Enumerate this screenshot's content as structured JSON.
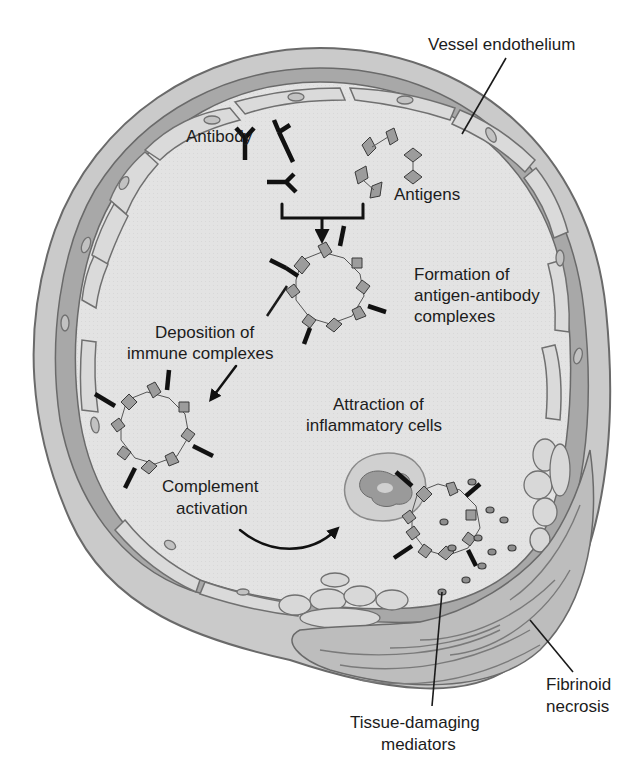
{
  "figure": {
    "type": "diagram",
    "colors": {
      "background": "#ffffff",
      "vessel_outer_wall": "#c9c9c9",
      "vessel_media_band": "#a8a8a8",
      "lumen": "#e4e4e4",
      "endothelial_cell": "#dadada",
      "outline": "#6a6a6a",
      "antigen": "#9c9c9c",
      "antibody": "#111111",
      "text": "#1c1c1c"
    }
  },
  "labels": {
    "vessel_endothelium": "Vessel endothelium",
    "antibody": "Antibody",
    "antigens": "Antigens",
    "formation_line1": "Formation of",
    "formation_line2": "antigen-antibody",
    "formation_line3": "complexes",
    "deposition_line1": "Deposition of",
    "deposition_line2": "immune complexes",
    "attraction_line1": "Attraction of",
    "attraction_line2": "inflammatory cells",
    "complement_line1": "Complement",
    "complement_line2": "activation",
    "fibrinoid_line1": "Fibrinoid",
    "fibrinoid_line2": "necrosis",
    "tissue_line1": "Tissue-damaging",
    "tissue_line2": "mediators"
  },
  "sequence": [
    "Antibody",
    "Antigens",
    "Formation of antigen-antibody complexes",
    "Deposition of immune complexes",
    "Complement activation",
    "Attraction of inflammatory cells",
    "Tissue-damaging mediators",
    "Fibrinoid necrosis"
  ]
}
